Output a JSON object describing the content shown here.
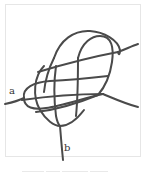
{
  "figure": {
    "type": "knot-diagram",
    "labels": {
      "a": "a",
      "b": "b"
    },
    "rope_color": "#4a4a4a",
    "frame_border_color": "#e6e6e6",
    "caption_visible": true
  }
}
